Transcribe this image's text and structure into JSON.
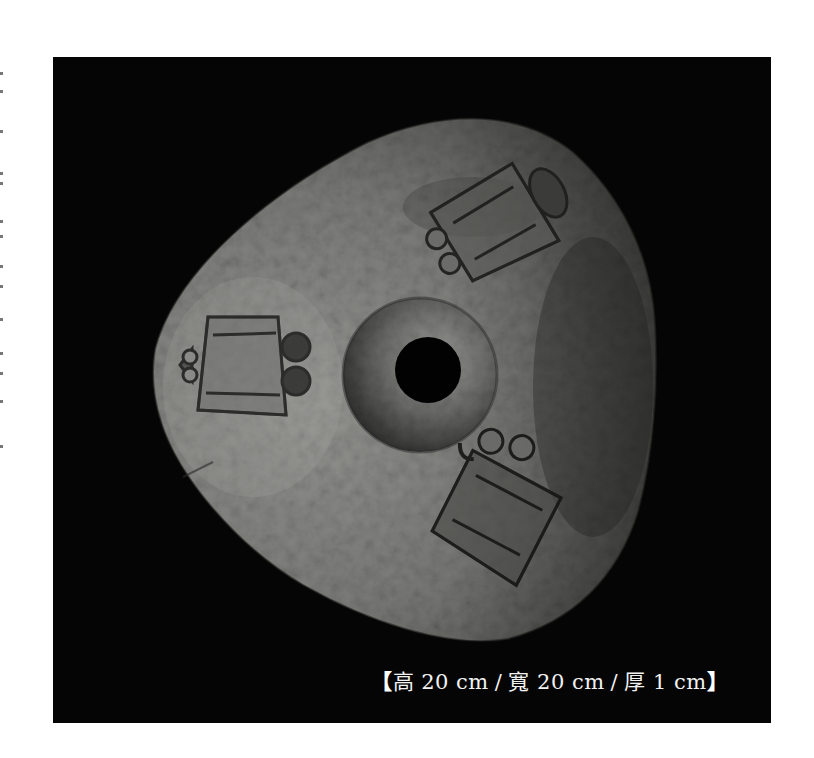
{
  "photo": {
    "subject": "carved stone disc with central perforation and three face motifs",
    "background_color": "#050505",
    "stone_color_light": "#8a8a88",
    "stone_color_dark": "#3a3a39",
    "motifs": [
      {
        "position": "upper-right",
        "icon": "carved-face-motif"
      },
      {
        "position": "left",
        "icon": "carved-face-motif"
      },
      {
        "position": "lower-right",
        "icon": "carved-face-motif"
      }
    ],
    "center": {
      "icon": "perforation-hole"
    }
  },
  "caption": {
    "open_bracket": "【",
    "height_label": "高",
    "height_value": "20 cm",
    "separator": "/",
    "width_label": "寬",
    "width_value": "20 cm",
    "thickness_label": "厚",
    "thickness_value": "1 cm",
    "close_bracket": "】",
    "text_color": "#f2f2f2"
  }
}
